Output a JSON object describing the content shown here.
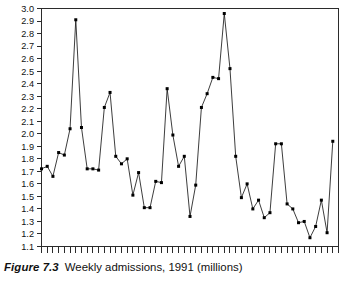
{
  "caption": {
    "label": "Figure 7.3",
    "text": "Weekly admissions, 1991 (millions)"
  },
  "chart_data": {
    "type": "line",
    "title": "Weekly admissions, 1991 (millions)",
    "xlabel": "",
    "ylabel": "",
    "ylim": [
      1.1,
      3.0
    ],
    "ytick_step": 0.1,
    "grid": false,
    "legend": "none",
    "marker": "square",
    "line_color": "#1a1a1a",
    "marker_color": "#000000",
    "ytick_labels": [
      "3.0",
      "2.9",
      "2.8",
      "2.7",
      "2.6",
      "2.5",
      "2.4",
      "2.3",
      "2.2",
      "2.1",
      "2.0",
      "1.9",
      "1.8",
      "1.7",
      "1.6",
      "1.5",
      "1.4",
      "1.3",
      "1.2",
      "1.1"
    ],
    "yticks": [
      3.0,
      2.9,
      2.8,
      2.7,
      2.6,
      2.5,
      2.4,
      2.3,
      2.2,
      2.1,
      2.0,
      1.9,
      1.8,
      1.7,
      1.6,
      1.5,
      1.4,
      1.3,
      1.2,
      1.1
    ],
    "xtick_labels": [
      "Jan",
      "June",
      "Dec"
    ],
    "xtick_label_positions": [
      3,
      26,
      51
    ],
    "n_xticks": 53,
    "x": [
      1,
      2,
      3,
      4,
      5,
      6,
      7,
      8,
      9,
      10,
      11,
      12,
      13,
      14,
      15,
      16,
      17,
      18,
      19,
      20,
      21,
      22,
      23,
      24,
      25,
      26,
      27,
      28,
      29,
      30,
      31,
      32,
      33,
      34,
      35,
      36,
      37,
      38,
      39,
      40,
      41,
      42,
      43,
      44,
      45,
      46,
      47,
      48,
      49,
      50,
      51,
      52
    ],
    "values": [
      1.72,
      1.74,
      1.66,
      1.85,
      1.83,
      2.04,
      2.91,
      2.05,
      1.72,
      1.72,
      1.71,
      2.21,
      2.33,
      1.82,
      1.76,
      1.8,
      1.51,
      1.69,
      1.41,
      1.41,
      1.62,
      1.61,
      2.36,
      1.99,
      1.74,
      1.82,
      1.34,
      1.59,
      2.21,
      2.32,
      2.45,
      2.44,
      2.96,
      2.52,
      1.82,
      1.49,
      1.6,
      1.4,
      1.47,
      1.33,
      1.37,
      1.92,
      1.92,
      1.44,
      1.4,
      1.29,
      1.3,
      1.17,
      1.26,
      1.47,
      1.21,
      1.94
    ]
  }
}
